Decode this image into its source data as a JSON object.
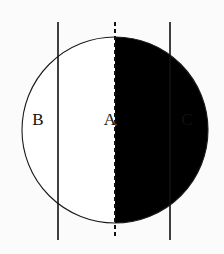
{
  "figure": {
    "canvas": {
      "width": 224,
      "height": 254,
      "background": "#fbfbfb"
    },
    "circle": {
      "name": "main-circle",
      "cx": 115,
      "cy": 130,
      "r": 93,
      "stroke": "#1a1a1a",
      "stroke_width": 1.1,
      "fill": "#ffffff"
    },
    "shaded_region": {
      "name": "right-half-disk",
      "description": "right semicircular half filled solid black",
      "fill": "#000000"
    },
    "center_line": {
      "name": "vertical-diameter-dashed",
      "x": 115,
      "y_top": 22,
      "y_bottom": 237,
      "style": "dashed",
      "dash_pattern": "4 3",
      "stroke": "#111111",
      "stroke_width": 2.0
    },
    "vertical_lines": [
      {
        "name": "left-secant-line",
        "x": 58,
        "y_top": 22,
        "y_bottom": 240,
        "stroke": "#111111",
        "stroke_width": 1.6
      },
      {
        "name": "right-secant-line",
        "x": 170,
        "y_top": 22,
        "y_bottom": 240,
        "stroke": "#111111",
        "stroke_width": 1.6
      }
    ],
    "labels": [
      {
        "name": "label-b",
        "text": "B",
        "x": 38,
        "y": 121
      },
      {
        "name": "label-a",
        "text": "A",
        "x": 110,
        "y": 121
      },
      {
        "name": "label-c",
        "text": "C",
        "x": 187,
        "y": 121
      }
    ]
  }
}
